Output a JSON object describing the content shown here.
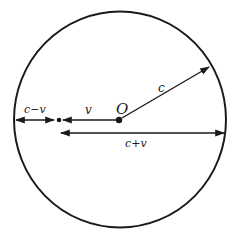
{
  "diagram": {
    "type": "circle-velocity-diagram",
    "colors": {
      "stroke": "#1a1a1a",
      "background": "#ffffff"
    },
    "circle": {
      "cx": 120,
      "cy": 119.5,
      "rx": 106,
      "ry": 108
    },
    "center_label": "O",
    "labels": {
      "radius": "c",
      "velocity": "v",
      "left_gap": "c−v",
      "right_span": "c+v"
    }
  }
}
